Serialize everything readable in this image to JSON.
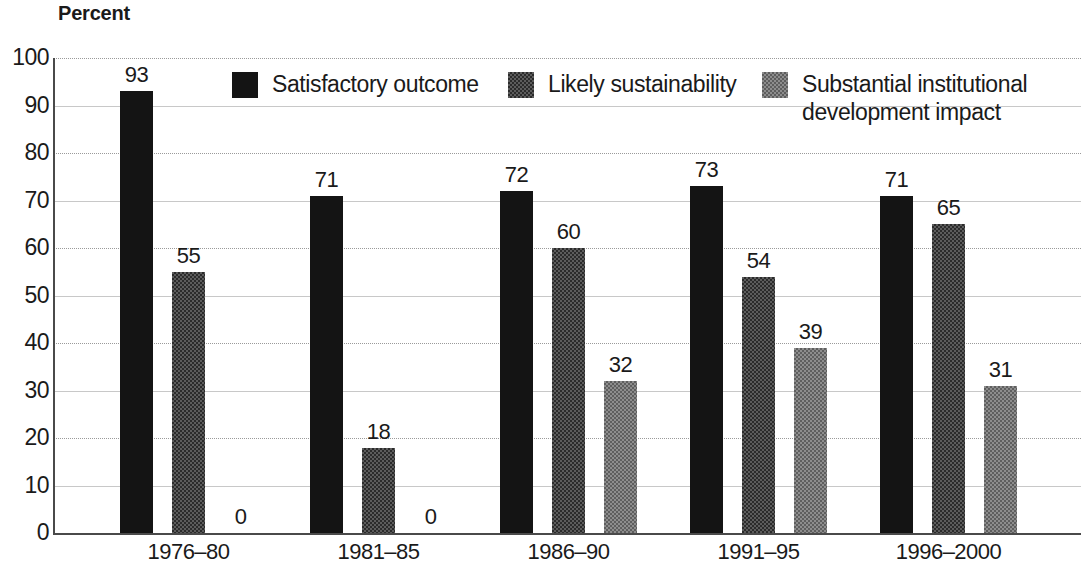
{
  "chart_data": {
    "type": "bar",
    "title": "Percent",
    "xlabel": "",
    "ylabel": "Percent",
    "ylim": [
      0,
      100
    ],
    "ytick_values": [
      100,
      90,
      80,
      70,
      60,
      50,
      40,
      30,
      20,
      10,
      0
    ],
    "ytick_labels": [
      "100",
      "90",
      "80",
      "70",
      "60",
      "50",
      "40",
      "30",
      "20",
      "10",
      "0"
    ],
    "grid": true,
    "grid_axis": "y",
    "legend_position": "top",
    "categories": [
      "1976–80",
      "1981–85",
      "1986–90",
      "1991–95",
      "1996–2000"
    ],
    "series": [
      {
        "name": "Satisfactory outcome",
        "color": "#141414",
        "values": [
          93,
          71,
          72,
          73,
          71
        ],
        "labels": [
          "93",
          "71",
          "72",
          "73",
          "71"
        ]
      },
      {
        "name": "Likely sustainability",
        "color": "#5c5c5c",
        "values": [
          55,
          18,
          60,
          54,
          65
        ],
        "labels": [
          "55",
          "18",
          "60",
          "54",
          "65"
        ]
      },
      {
        "name": "Substantial institutional\ndevelopment impact",
        "color": "#8d8d8d",
        "values": [
          0,
          0,
          32,
          39,
          31
        ],
        "labels": [
          "0",
          "0",
          "32",
          "39",
          "31"
        ]
      }
    ]
  },
  "legend": {
    "items": [
      {
        "label": "Satisfactory outcome",
        "swatch": "black-swatch"
      },
      {
        "label": "Likely sustainability",
        "swatch": "mid-gray-swatch"
      },
      {
        "label": "Substantial institutional\ndevelopment impact",
        "swatch": "light-gray-swatch"
      }
    ]
  }
}
